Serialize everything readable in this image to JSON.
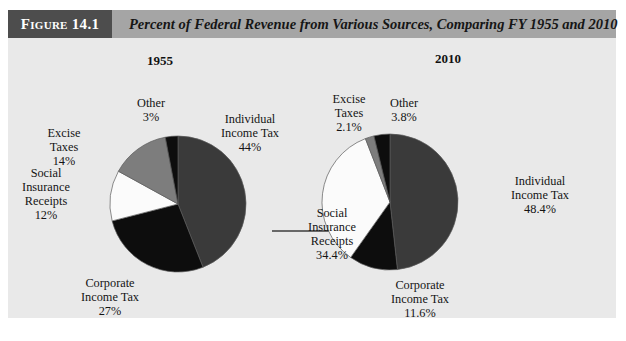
{
  "figure": {
    "number_label": "Figure 14.1",
    "title": "Percent of Federal Revenue from Various Sources, Comparing FY 1955 and 2010"
  },
  "colors": {
    "panel_background": "#e9e9e9",
    "header_bar": "#a5a5a5",
    "number_box": "#4d4d4d",
    "number_text": "#ffffff",
    "title_text": "#161616",
    "individual_income_tax": "#3a3a3a",
    "corporate_income_tax": "#0d0d0d",
    "social_insurance_receipts": "#fbfbfb",
    "excise_taxes": "#7d7d7d",
    "other": "#0d0d0d",
    "slice_outline": "#5a5a5a",
    "arrow": "#3d3d3d"
  },
  "arrow": {
    "name": "transition-arrow"
  },
  "chart_data": [
    {
      "type": "pie",
      "title": "1955",
      "xlabel": "",
      "ylabel": "",
      "categories": [
        "Individual Income Tax",
        "Corporate Income Tax",
        "Social Insurance Receipts",
        "Excise Taxes",
        "Other"
      ],
      "values": [
        44,
        27,
        12,
        14,
        3
      ],
      "value_labels": [
        "44%",
        "27%",
        "12%",
        "14%",
        "3%"
      ],
      "colors": [
        "#3a3a3a",
        "#0d0d0d",
        "#fbfbfb",
        "#7d7d7d",
        "#0d0d0d"
      ],
      "start_angle_deg": 0,
      "direction": "clockwise",
      "legend": "none",
      "grid": false,
      "labels": [
        {
          "name": "individual-income-tax",
          "line1": "Individual",
          "line2": "Income Tax",
          "pct": "44%"
        },
        {
          "name": "corporate-income-tax",
          "line1": "Corporate",
          "line2": "Income Tax",
          "pct": "27%"
        },
        {
          "name": "social-insurance-receipts",
          "line1": "Social",
          "line2": "Insurance",
          "line3": "Receipts",
          "pct": "12%"
        },
        {
          "name": "excise-taxes",
          "line1": "Excise",
          "line2": "Taxes",
          "pct": "14%"
        },
        {
          "name": "other",
          "line1": "Other",
          "pct": "3%"
        }
      ]
    },
    {
      "type": "pie",
      "title": "2010",
      "xlabel": "",
      "ylabel": "",
      "categories": [
        "Individual Income Tax",
        "Corporate Income Tax",
        "Social Insurance Receipts",
        "Excise Taxes",
        "Other"
      ],
      "values": [
        48.4,
        11.6,
        34.4,
        2.1,
        3.8
      ],
      "value_labels": [
        "48.4%",
        "11.6%",
        "34.4%",
        "2.1%",
        "3.8%"
      ],
      "colors": [
        "#3a3a3a",
        "#0d0d0d",
        "#fbfbfb",
        "#7d7d7d",
        "#0d0d0d"
      ],
      "start_angle_deg": 0,
      "direction": "clockwise",
      "legend": "none",
      "grid": false,
      "labels": [
        {
          "name": "individual-income-tax",
          "line1": "Individual",
          "line2": "Income Tax",
          "pct": "48.4%"
        },
        {
          "name": "corporate-income-tax",
          "line1": "Corporate",
          "line2": "Income Tax",
          "pct": "11.6%"
        },
        {
          "name": "social-insurance-receipts",
          "line1": "Social",
          "line2": "Insurance",
          "line3": "Receipts",
          "pct": "34.4%"
        },
        {
          "name": "excise-taxes",
          "line1": "Excise",
          "line2": "Taxes",
          "pct": "2.1%"
        },
        {
          "name": "other",
          "line1": "Other",
          "pct": "3.8%"
        }
      ]
    }
  ]
}
